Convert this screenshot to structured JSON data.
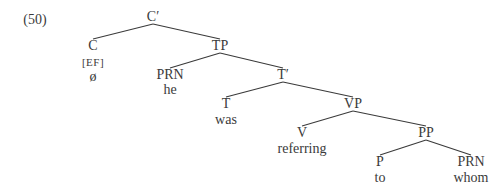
{
  "example_number": "(50)",
  "colors": {
    "text": "#3a3a3a",
    "line": "#3a3a3a",
    "background": "#ffffff"
  },
  "nodes": {
    "cbar": {
      "label": "C′",
      "x": 153,
      "y": 17
    },
    "c": {
      "label": "C",
      "x": 93,
      "y": 46,
      "feature": "[EF]",
      "word": "ø"
    },
    "tp": {
      "label": "TP",
      "x": 220,
      "y": 46
    },
    "prn1": {
      "label": "PRN",
      "x": 170,
      "y": 75,
      "word": "he"
    },
    "tbar": {
      "label": "T′",
      "x": 283,
      "y": 75
    },
    "t": {
      "label": "T",
      "x": 226,
      "y": 104,
      "word": "was"
    },
    "vp": {
      "label": "VP",
      "x": 353,
      "y": 104
    },
    "v": {
      "label": "V",
      "x": 302,
      "y": 133,
      "word": "referring"
    },
    "pp": {
      "label": "PP",
      "x": 426,
      "y": 133
    },
    "p": {
      "label": "P",
      "x": 380,
      "y": 162,
      "word": "to"
    },
    "prn2": {
      "label": "PRN",
      "x": 471,
      "y": 162,
      "word": "whom"
    }
  },
  "edges": [
    [
      "cbar",
      "c"
    ],
    [
      "cbar",
      "tp"
    ],
    [
      "tp",
      "prn1"
    ],
    [
      "tp",
      "tbar"
    ],
    [
      "tbar",
      "t"
    ],
    [
      "tbar",
      "vp"
    ],
    [
      "vp",
      "v"
    ],
    [
      "vp",
      "pp"
    ],
    [
      "pp",
      "p"
    ],
    [
      "pp",
      "prn2"
    ]
  ]
}
